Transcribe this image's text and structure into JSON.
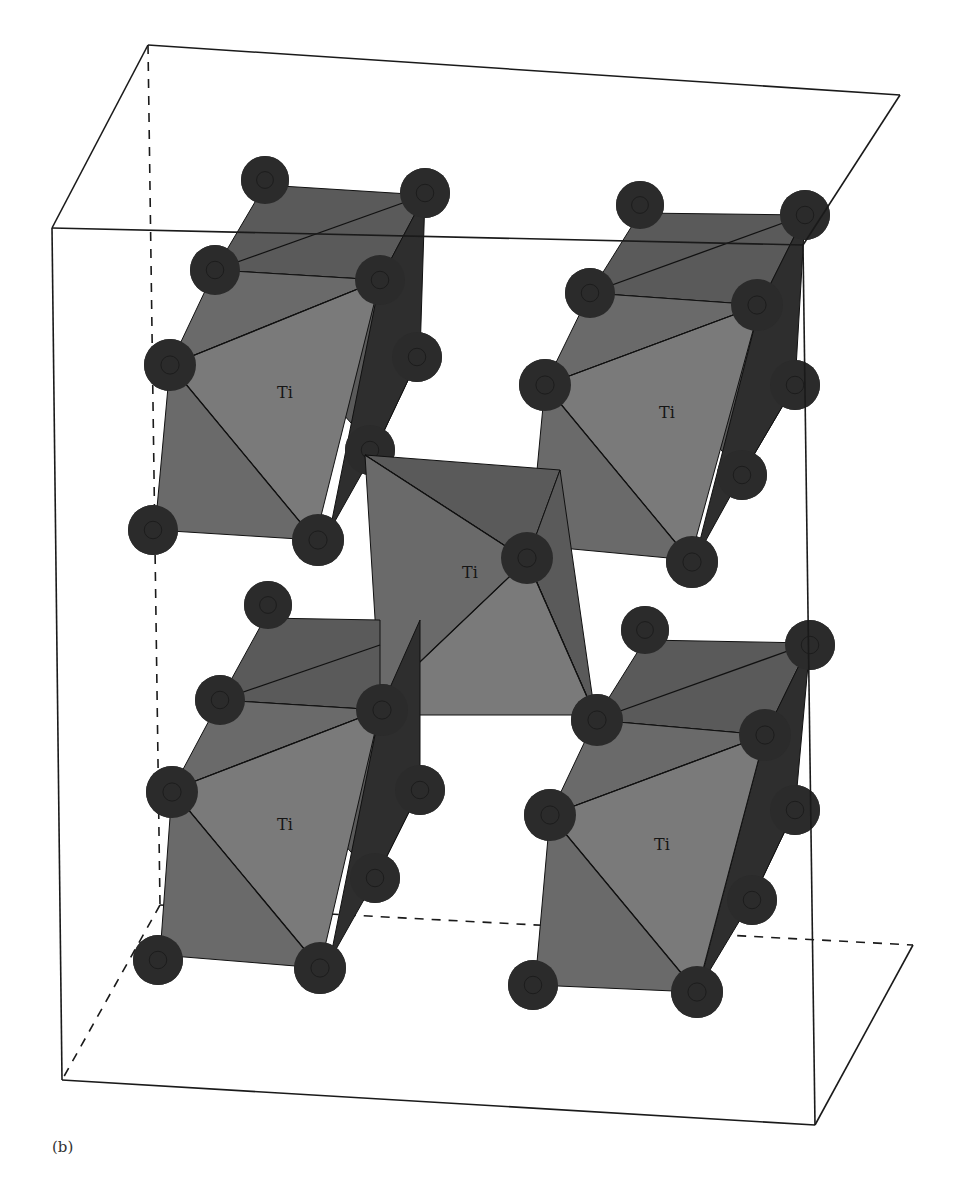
{
  "figure": {
    "caption": "(b)",
    "atom_label": "Ti",
    "colors": {
      "background": "#ffffff",
      "face_light": "#7a7a7a",
      "face_mid": "#6a6a6a",
      "face_dark": "#5a5a5a",
      "face_side": "#2e2e2e",
      "atom": "#2b2b2b",
      "edge": "#111111",
      "box_line": "#1a1a1a"
    },
    "unit_cell": {
      "solid_lines": [
        [
          52,
          228,
          803,
          245
        ],
        [
          52,
          228,
          148,
          45
        ],
        [
          148,
          45,
          900,
          95
        ],
        [
          900,
          95,
          803,
          245
        ],
        [
          52,
          228,
          62,
          1080
        ],
        [
          803,
          245,
          815,
          1125
        ],
        [
          62,
          1080,
          815,
          1125
        ],
        [
          815,
          1125,
          913,
          945
        ]
      ],
      "dashed_lines": [
        [
          148,
          45,
          160,
          905
        ],
        [
          160,
          905,
          62,
          1080
        ],
        [
          160,
          905,
          913,
          945
        ]
      ]
    },
    "octahedra": [
      {
        "id": "top-left",
        "label_pos": [
          285,
          398
        ],
        "back_faces": [
          [
            [
              265,
              185
            ],
            [
              425,
              195
            ],
            [
              380,
              280
            ],
            [
              215,
              270
            ]
          ],
          [
            [
              215,
              270
            ],
            [
              380,
              280
            ],
            [
              420,
              355
            ],
            [
              375,
              450
            ]
          ]
        ],
        "side_faces": [
          [
            [
              425,
              195
            ],
            [
              380,
              280
            ],
            [
              330,
              530
            ],
            [
              375,
              450
            ],
            [
              420,
              355
            ]
          ]
        ],
        "front_faces": [
          [
            [
              215,
              270
            ],
            [
              380,
              280
            ],
            [
              170,
              365
            ]
          ],
          [
            [
              170,
              365
            ],
            [
              380,
              280
            ],
            [
              315,
              540
            ]
          ],
          [
            [
              170,
              365
            ],
            [
              315,
              540
            ],
            [
              155,
              530
            ]
          ]
        ],
        "edges": [
          [
            [
              215,
              270
            ],
            [
              425,
              195
            ]
          ],
          [
            [
              170,
              365
            ],
            [
              380,
              280
            ]
          ],
          [
            [
              170,
              365
            ],
            [
              315,
              540
            ]
          ]
        ],
        "atoms": [
          [
            265,
            180,
            24
          ],
          [
            425,
            193,
            25
          ],
          [
            215,
            270,
            25
          ],
          [
            380,
            280,
            25
          ],
          [
            170,
            365,
            26
          ],
          [
            417,
            357,
            25
          ],
          [
            370,
            450,
            25
          ],
          [
            153,
            530,
            25
          ],
          [
            318,
            540,
            26
          ]
        ]
      },
      {
        "id": "top-right",
        "label_pos": [
          667,
          418
        ],
        "back_faces": [
          [
            [
              640,
              213
            ],
            [
              805,
              215
            ],
            [
              760,
              305
            ],
            [
              590,
              293
            ]
          ],
          [
            [
              590,
              293
            ],
            [
              760,
              305
            ],
            [
              795,
              385
            ],
            [
              742,
              475
            ]
          ]
        ],
        "side_faces": [
          [
            [
              805,
              215
            ],
            [
              760,
              305
            ],
            [
              695,
              560
            ],
            [
              742,
              475
            ],
            [
              795,
              385
            ]
          ]
        ],
        "front_faces": [
          [
            [
              590,
              293
            ],
            [
              760,
              305
            ],
            [
              545,
              385
            ]
          ],
          [
            [
              545,
              385
            ],
            [
              760,
              305
            ],
            [
              690,
              560
            ]
          ],
          [
            [
              545,
              385
            ],
            [
              690,
              560
            ],
            [
              530,
              545
            ]
          ]
        ],
        "edges": [
          [
            [
              590,
              293
            ],
            [
              805,
              215
            ]
          ],
          [
            [
              545,
              385
            ],
            [
              760,
              305
            ]
          ],
          [
            [
              545,
              385
            ],
            [
              690,
              560
            ]
          ]
        ],
        "atoms": [
          [
            640,
            205,
            24
          ],
          [
            805,
            215,
            25
          ],
          [
            590,
            293,
            25
          ],
          [
            757,
            305,
            26
          ],
          [
            545,
            385,
            26
          ],
          [
            795,
            385,
            25
          ],
          [
            742,
            475,
            25
          ],
          [
            525,
            545,
            25
          ],
          [
            692,
            562,
            26
          ]
        ]
      },
      {
        "id": "center",
        "label_pos": [
          470,
          578
        ],
        "back_faces": [
          [
            [
              365,
              455
            ],
            [
              560,
              470
            ],
            [
              527,
              560
            ]
          ],
          [
            [
              527,
              560
            ],
            [
              560,
              470
            ],
            [
              595,
              715
            ]
          ]
        ],
        "side_faces": [
          [
            [
              527,
              560
            ],
            [
              595,
              715
            ],
            [
              575,
              685
            ]
          ]
        ],
        "front_faces": [
          [
            [
              365,
              455
            ],
            [
              527,
              560
            ],
            [
              380,
              700
            ]
          ],
          [
            [
              380,
              700
            ],
            [
              527,
              560
            ],
            [
              595,
              715
            ],
            [
              400,
              715
            ]
          ]
        ],
        "edges": [
          [
            [
              365,
              455
            ],
            [
              527,
              560
            ]
          ],
          [
            [
              527,
              560
            ],
            [
              380,
              700
            ]
          ],
          [
            [
              527,
              560
            ],
            [
              595,
              715
            ]
          ]
        ],
        "atoms": [
          [
            527,
            558,
            26
          ]
        ]
      },
      {
        "id": "bottom-left",
        "label_pos": [
          285,
          830
        ],
        "back_faces": [
          [
            [
              265,
              618
            ],
            [
              380,
              620
            ],
            [
              380,
              710
            ],
            [
              220,
              700
            ]
          ],
          [
            [
              220,
              700
            ],
            [
              380,
              710
            ],
            [
              420,
              790
            ],
            [
              375,
              880
            ]
          ]
        ],
        "side_faces": [
          [
            [
              420,
              620
            ],
            [
              380,
              710
            ],
            [
              330,
              960
            ],
            [
              375,
              880
            ],
            [
              420,
              790
            ]
          ]
        ],
        "front_faces": [
          [
            [
              220,
              700
            ],
            [
              380,
              710
            ],
            [
              172,
              790
            ]
          ],
          [
            [
              172,
              790
            ],
            [
              380,
              710
            ],
            [
              320,
              968
            ]
          ],
          [
            [
              172,
              790
            ],
            [
              320,
              968
            ],
            [
              160,
              955
            ]
          ]
        ],
        "edges": [
          [
            [
              220,
              700
            ],
            [
              380,
              645
            ]
          ],
          [
            [
              172,
              790
            ],
            [
              380,
              710
            ]
          ],
          [
            [
              172,
              790
            ],
            [
              320,
              968
            ]
          ]
        ],
        "atoms": [
          [
            268,
            605,
            24
          ],
          [
            220,
            700,
            25
          ],
          [
            382,
            710,
            26
          ],
          [
            172,
            792,
            26
          ],
          [
            420,
            790,
            25
          ],
          [
            375,
            878,
            25
          ],
          [
            158,
            960,
            25
          ],
          [
            320,
            968,
            26
          ]
        ]
      },
      {
        "id": "bottom-right",
        "label_pos": [
          662,
          850
        ],
        "back_faces": [
          [
            [
              645,
              640
            ],
            [
              810,
              643
            ],
            [
              765,
              735
            ],
            [
              595,
              720
            ]
          ],
          [
            [
              595,
              720
            ],
            [
              765,
              735
            ],
            [
              795,
              810
            ],
            [
              752,
              900
            ]
          ]
        ],
        "side_faces": [
          [
            [
              810,
              643
            ],
            [
              765,
              735
            ],
            [
              698,
              990
            ],
            [
              752,
              900
            ],
            [
              795,
              810
            ]
          ]
        ],
        "front_faces": [
          [
            [
              595,
              720
            ],
            [
              765,
              735
            ],
            [
              550,
              815
            ]
          ],
          [
            [
              550,
              815
            ],
            [
              765,
              735
            ],
            [
              697,
              992
            ]
          ],
          [
            [
              550,
              815
            ],
            [
              697,
              992
            ],
            [
              535,
              985
            ]
          ]
        ],
        "edges": [
          [
            [
              595,
              720
            ],
            [
              810,
              643
            ]
          ],
          [
            [
              550,
              815
            ],
            [
              765,
              735
            ]
          ],
          [
            [
              550,
              815
            ],
            [
              697,
              992
            ]
          ]
        ],
        "atoms": [
          [
            645,
            630,
            24
          ],
          [
            810,
            645,
            25
          ],
          [
            597,
            720,
            26
          ],
          [
            765,
            735,
            26
          ],
          [
            550,
            815,
            26
          ],
          [
            795,
            810,
            25
          ],
          [
            752,
            900,
            25
          ],
          [
            533,
            985,
            25
          ],
          [
            697,
            992,
            26
          ]
        ]
      }
    ]
  }
}
